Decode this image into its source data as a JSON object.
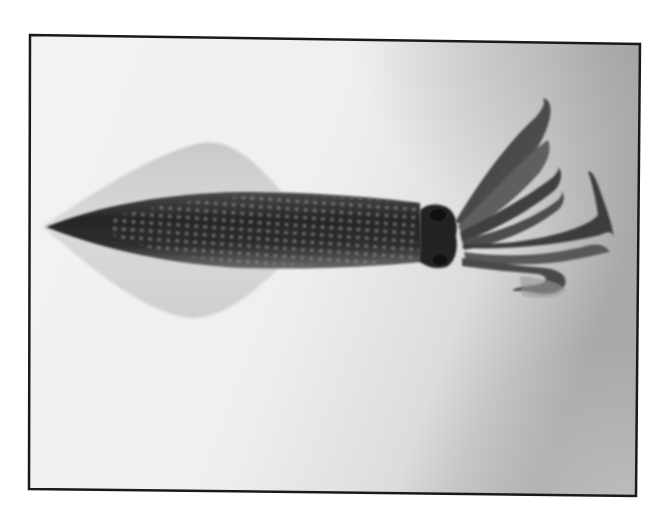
{
  "image": {
    "subject": "squid",
    "description": "Grayscale photograph of a squid viewed from above, fins on the left, arms on the right, inside a thin black rectangular frame",
    "colors": {
      "page_background": "#ffffff",
      "frame_border": "#1a1a1a",
      "photo_background_light": "#f2f2f2",
      "photo_background_dark": "#a8a8a8",
      "mantle_dark": "#2b2b2b",
      "fin_light": "#d4d4d4",
      "chromatophore_spots": "#8a8a8a"
    }
  }
}
